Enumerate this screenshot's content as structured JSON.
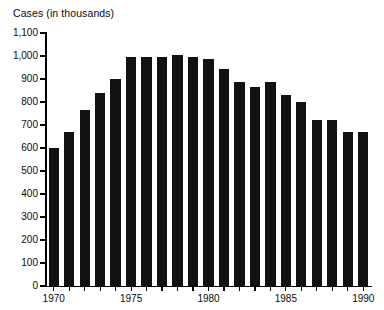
{
  "chart_data": {
    "type": "bar",
    "title": "Cases (in thousands)",
    "xlabel": "",
    "ylabel": "Cases (in thousands)",
    "ylim": [
      0,
      1100
    ],
    "ytick_step": 100,
    "grid": false,
    "legend": null,
    "bar_color": "#111111",
    "background_color": "#ffffff",
    "axis_color": "#000000",
    "ytick_labels": [
      "1,100",
      "1,000",
      "900",
      "800",
      "700",
      "600",
      "500",
      "400",
      "300",
      "200",
      "100",
      "0"
    ],
    "ytick_values": [
      1100,
      1000,
      900,
      800,
      700,
      600,
      500,
      400,
      300,
      200,
      100,
      0
    ],
    "xtick_labels": [
      "1970",
      "1975",
      "1980",
      "1985",
      "1990"
    ],
    "xtick_values": [
      1970,
      1975,
      1980,
      1985,
      1990
    ],
    "categories": [
      "1970",
      "1971",
      "1972",
      "1973",
      "1974",
      "1975",
      "1976",
      "1977",
      "1978",
      "1979",
      "1980",
      "1981",
      "1982",
      "1983",
      "1984",
      "1985",
      "1986",
      "1987",
      "1988",
      "1989",
      "1990"
    ],
    "values": [
      600,
      670,
      765,
      840,
      900,
      995,
      995,
      995,
      1005,
      995,
      985,
      945,
      885,
      865,
      885,
      830,
      800,
      720,
      720,
      670,
      670
    ]
  }
}
